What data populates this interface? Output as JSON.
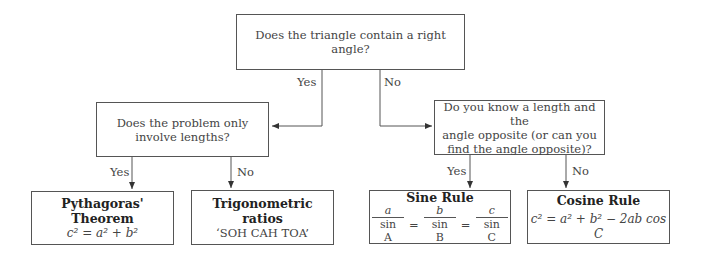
{
  "diagram": {
    "root_question": "Does the triangle contain a right angle?",
    "branch_labels": {
      "root_yes": "Yes",
      "root_no": "No",
      "left_yes": "Yes",
      "left_no": "No",
      "right_yes": "Yes",
      "right_no": "No"
    },
    "left_question": {
      "line1": "Does the problem only",
      "line2": "involve lengths?"
    },
    "right_question": {
      "line1": "Do you know a length and the",
      "line2": "angle opposite (or can you",
      "line3": "find the angle opposite)?"
    },
    "outcomes": {
      "pythagoras": {
        "title_line1": "Pythagoras'",
        "title_line2": "Theorem",
        "formula": "c² = a² + b²"
      },
      "trig_ratios": {
        "title_line1": "Trigonometric",
        "title_line2": "ratios",
        "text": "‘SOH CAH TOA’"
      },
      "sine_rule": {
        "title": "Sine Rule",
        "num1": "a",
        "den1": "sin A",
        "num2": "b",
        "den2": "sin B",
        "num3": "c",
        "den3": "sin C",
        "equals": "="
      },
      "cosine_rule": {
        "title": "Cosine Rule",
        "formula": "c² = a² + b² − 2ab cos C"
      }
    },
    "colors": {
      "line": "#555555",
      "text": "#444444",
      "background": "#ffffff"
    }
  }
}
